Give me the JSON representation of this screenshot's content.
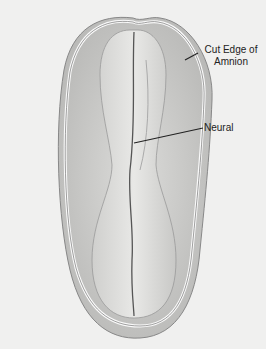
{
  "figure": {
    "labels": [
      {
        "id": "cut-edge",
        "line1": "Cut Edge of",
        "line2": "Amnion"
      },
      {
        "id": "neural",
        "text": "Neural"
      }
    ],
    "colors": {
      "background": "#f0f0ef",
      "tissue": "#d2d2d0",
      "shade": "#9a9a98",
      "line": "#222222"
    }
  }
}
